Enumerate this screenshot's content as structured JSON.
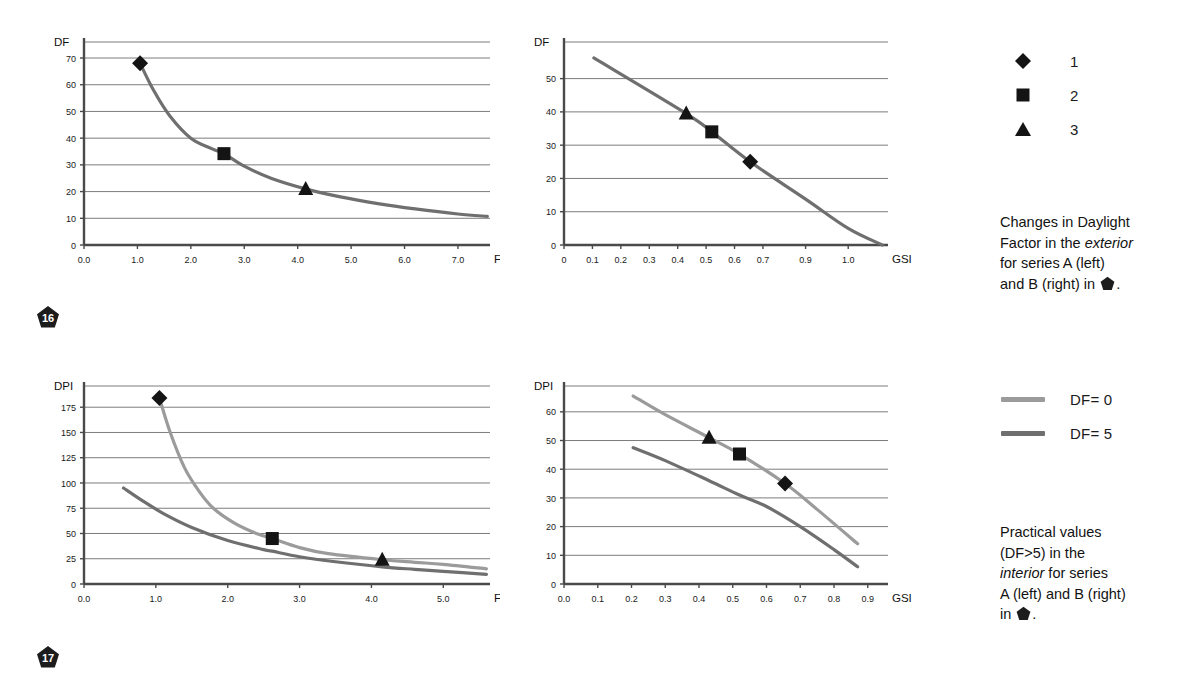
{
  "page": {
    "background": "#ffffff",
    "grid_color": "#6d6d6d",
    "axis_color": "#555555",
    "series_light_color": "#9b9b9b",
    "series_dark_color": "#6f6f6f",
    "marker_color": "#141414",
    "badge_color": "#1c1c1c"
  },
  "figures": [
    {
      "badge": "16",
      "caption_parts": {
        "line1": "Changes in Daylight",
        "line2_pre": "Factor in the ",
        "line2_em": "exterior",
        "line3": "for series A (left)",
        "line4_pre": "and B (right) in ",
        "line4_post": "."
      },
      "legend": {
        "type": "markers",
        "items": [
          {
            "marker": "diamond-marker",
            "label": "1"
          },
          {
            "marker": "square-marker",
            "label": "2"
          },
          {
            "marker": "triangle-marker",
            "label": "3"
          }
        ]
      }
    },
    {
      "badge": "17",
      "caption_parts": {
        "line1": "Practical values",
        "line2": "(DF>5) in the",
        "line3_em": "interior",
        "line3_post": " for series",
        "line4": "A (left) and B (right)",
        "line5_pre": "in ",
        "line5_post": "."
      },
      "legend": {
        "type": "lines",
        "items": [
          {
            "swatch": "light-line-swatch",
            "label": "DF= 0",
            "color": "#9b9b9b"
          },
          {
            "swatch": "dark-line-swatch",
            "label": "DF= 5",
            "color": "#6f6f6f"
          }
        ]
      }
    }
  ],
  "chart_data": [
    {
      "id": "chart-a-exterior-df-fsi",
      "type": "line",
      "title": "",
      "xlabel": "FSI",
      "ylabel": "DF",
      "xlim": [
        0.0,
        7.6
      ],
      "ylim": [
        0,
        76
      ],
      "xticks": [
        0.0,
        1.0,
        2.0,
        3.0,
        4.0,
        5.0,
        6.0,
        7.0
      ],
      "xticklabels": [
        "0.0",
        "1.0",
        "2.0",
        "3.0",
        "4.0",
        "5.0",
        "6.0",
        "7.0"
      ],
      "yticks": [
        0,
        10,
        20,
        30,
        40,
        50,
        60,
        70
      ],
      "yticklabels": [
        "0",
        "10",
        "20",
        "30",
        "40",
        "50",
        "60",
        "70"
      ],
      "grid": true,
      "series": [
        {
          "name": "DF curve",
          "color": "#6f6f6f",
          "x": [
            1.05,
            1.3,
            1.6,
            2.0,
            2.4,
            2.62,
            3.0,
            3.5,
            4.15,
            4.8,
            5.5,
            6.2,
            7.0,
            7.55
          ],
          "y": [
            68.0,
            58.0,
            48.5,
            40.0,
            36.0,
            34.2,
            29.5,
            25.0,
            21.0,
            18.0,
            15.5,
            13.5,
            11.6,
            10.7
          ]
        }
      ],
      "markers": [
        {
          "name": "diamond-marker",
          "label": "1",
          "x": 1.05,
          "y": 68.0
        },
        {
          "name": "square-marker",
          "label": "2",
          "x": 2.62,
          "y": 34.2
        },
        {
          "name": "triangle-marker",
          "label": "3",
          "x": 4.15,
          "y": 21.0
        }
      ]
    },
    {
      "id": "chart-b-exterior-df-gsi",
      "type": "line",
      "title": "",
      "xlabel": "GSI",
      "ylabel": "DF",
      "xlim": [
        0.0,
        1.14
      ],
      "ylim": [
        0,
        61
      ],
      "xticks": [
        0.0,
        0.1,
        0.2,
        0.3,
        0.4,
        0.5,
        0.6,
        0.7,
        0.85,
        1.0
      ],
      "xticklabels": [
        "0",
        "0.1",
        "0.2",
        "0.3",
        "0.4",
        "0.5",
        "0.6",
        "0.7",
        "0.9",
        "1.0"
      ],
      "yticks": [
        0,
        10,
        20,
        30,
        40,
        50
      ],
      "yticklabels": [
        "0",
        "10",
        "20",
        "30",
        "40",
        "50"
      ],
      "grid": true,
      "series": [
        {
          "name": "DF curve",
          "color": "#6f6f6f",
          "x": [
            0.105,
            0.43,
            0.52,
            0.655,
            0.85,
            1.0,
            1.12
          ],
          "y": [
            56.2,
            39.5,
            34.0,
            25.0,
            13.8,
            5.0,
            0.0
          ]
        }
      ],
      "markers": [
        {
          "name": "triangle-marker",
          "label": "3",
          "x": 0.43,
          "y": 39.5
        },
        {
          "name": "square-marker",
          "label": "2",
          "x": 0.52,
          "y": 34.0
        },
        {
          "name": "diamond-marker",
          "label": "1",
          "x": 0.655,
          "y": 25.0
        }
      ]
    },
    {
      "id": "chart-c-interior-dpi-fsi",
      "type": "line",
      "title": "",
      "xlabel": "FSI",
      "ylabel": "DPI",
      "xlim": [
        0.0,
        5.65
      ],
      "ylim": [
        0,
        196
      ],
      "xticks": [
        0.0,
        1.0,
        2.0,
        3.0,
        4.0,
        5.0
      ],
      "xticklabels": [
        "0.0",
        "1.0",
        "2.0",
        "3.0",
        "4.0",
        "5.0"
      ],
      "yticks": [
        0,
        25,
        50,
        75,
        100,
        125,
        150,
        175
      ],
      "yticklabels": [
        "0",
        "25",
        "50",
        "75",
        "100",
        "125",
        "150",
        "175"
      ],
      "grid": true,
      "series": [
        {
          "name": "DF= 0",
          "color": "#9b9b9b",
          "x": [
            1.05,
            1.2,
            1.4,
            1.6,
            1.8,
            2.1,
            2.4,
            2.62,
            3.0,
            3.4,
            4.15,
            4.6,
            5.0,
            5.6
          ],
          "y": [
            184.0,
            150.0,
            115.0,
            92.0,
            75.0,
            60.0,
            50.0,
            45.0,
            36.0,
            30.0,
            24.0,
            21.5,
            19.5,
            15.0
          ]
        },
        {
          "name": "DF= 5",
          "color": "#6f6f6f",
          "x": [
            0.55,
            0.8,
            1.1,
            1.5,
            2.0,
            2.5,
            2.62,
            3.0,
            3.5,
            4.15,
            4.6,
            5.0,
            5.6
          ],
          "y": [
            95.0,
            83.0,
            70.0,
            56.0,
            43.0,
            34.0,
            32.5,
            27.0,
            22.0,
            17.0,
            14.5,
            12.5,
            9.5
          ]
        }
      ],
      "markers": [
        {
          "name": "diamond-marker",
          "label": "1",
          "x": 1.05,
          "y": 184.0
        },
        {
          "name": "square-marker",
          "label": "2",
          "x": 2.62,
          "y": 45.0
        },
        {
          "name": "triangle-marker",
          "label": "3",
          "x": 4.15,
          "y": 24.0
        }
      ]
    },
    {
      "id": "chart-d-interior-dpi-gsi",
      "type": "line",
      "title": "",
      "xlabel": "GSI",
      "ylabel": "DPI",
      "xlim": [
        0.0,
        0.96
      ],
      "ylim": [
        0,
        69
      ],
      "xticks": [
        0.0,
        0.1,
        0.2,
        0.3,
        0.4,
        0.5,
        0.6,
        0.7,
        0.8,
        0.9
      ],
      "xticklabels": [
        "0.0",
        "0.1",
        "0.2",
        "0.3",
        "0.4",
        "0.5",
        "0.6",
        "0.7",
        "0.8",
        "0.9"
      ],
      "yticks": [
        0,
        10,
        20,
        30,
        40,
        50,
        60
      ],
      "yticklabels": [
        "0",
        "10",
        "20",
        "30",
        "40",
        "50",
        "60"
      ],
      "grid": true,
      "series": [
        {
          "name": "DF= 0",
          "color": "#9b9b9b",
          "x": [
            0.205,
            0.3,
            0.43,
            0.52,
            0.655,
            0.75,
            0.87
          ],
          "y": [
            65.5,
            59.0,
            51.0,
            45.3,
            35.0,
            26.0,
            14.0
          ]
        },
        {
          "name": "DF= 5",
          "color": "#6f6f6f",
          "x": [
            0.205,
            0.3,
            0.43,
            0.52,
            0.6,
            0.7,
            0.8,
            0.87
          ],
          "y": [
            47.5,
            43.0,
            36.0,
            31.0,
            27.0,
            20.0,
            12.0,
            6.0
          ]
        }
      ],
      "markers": [
        {
          "name": "triangle-marker",
          "label": "3",
          "x": 0.43,
          "y": 51.0
        },
        {
          "name": "square-marker",
          "label": "2",
          "x": 0.52,
          "y": 45.3
        },
        {
          "name": "diamond-marker",
          "label": "1",
          "x": 0.655,
          "y": 35.0
        }
      ]
    }
  ]
}
